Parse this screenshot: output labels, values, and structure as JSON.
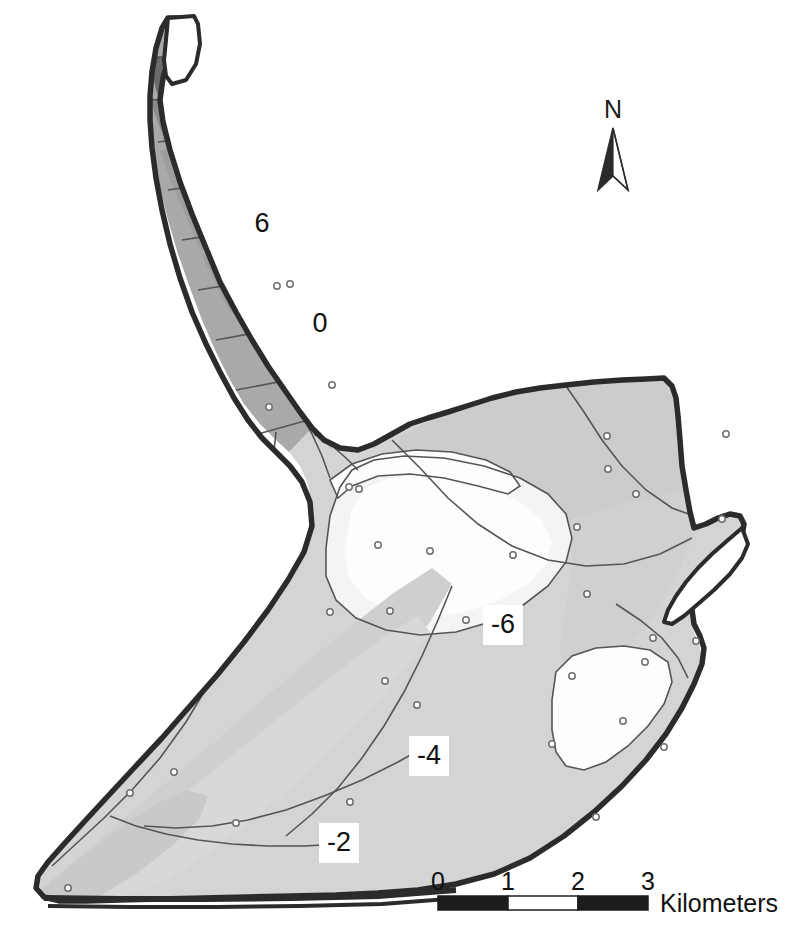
{
  "map": {
    "title": "",
    "background_color": "#ffffff",
    "outline_color": "#2b2b2b",
    "contour_line_color": "#555555",
    "point_marker_color": "#6e6e6e",
    "fill_levels": [
      {
        "name": "darkest",
        "color": "#686868",
        "value": "8"
      },
      {
        "name": "dark",
        "color": "#8d8d8d",
        "value": "6"
      },
      {
        "name": "medium",
        "color": "#a9a9a9",
        "value": "2"
      },
      {
        "name": "light",
        "color": "#c9c9c9",
        "value": "-2"
      },
      {
        "name": "lighter",
        "color": "#d6d6d6",
        "value": "-4"
      },
      {
        "name": "lightest",
        "color": "#e3e3e3",
        "value": "-6"
      },
      {
        "name": "white",
        "color": "#fdfdfd",
        "value": "-8"
      }
    ],
    "contour_labels": [
      {
        "id": "label-6",
        "text": "6",
        "x": 262,
        "y": 224
      },
      {
        "id": "label-0",
        "text": "0",
        "x": 320,
        "y": 324
      },
      {
        "id": "label-n6",
        "text": "-6",
        "x": 503,
        "y": 625
      },
      {
        "id": "label-n4",
        "text": "-4",
        "x": 429,
        "y": 756
      },
      {
        "id": "label-n2",
        "text": "-2",
        "x": 339,
        "y": 843
      }
    ],
    "sample_points": [
      [
        277,
        286
      ],
      [
        290,
        284
      ],
      [
        332,
        385
      ],
      [
        269,
        407
      ],
      [
        349,
        487
      ],
      [
        359,
        489
      ],
      [
        378,
        545
      ],
      [
        430,
        551
      ],
      [
        513,
        555
      ],
      [
        466,
        620
      ],
      [
        577,
        527
      ],
      [
        607,
        436
      ],
      [
        608,
        469
      ],
      [
        636,
        494
      ],
      [
        587,
        594
      ],
      [
        653,
        638
      ],
      [
        572,
        676
      ],
      [
        645,
        662
      ],
      [
        722,
        519
      ],
      [
        726,
        434
      ],
      [
        696,
        641
      ],
      [
        623,
        721
      ],
      [
        664,
        747
      ],
      [
        552,
        744
      ],
      [
        596,
        817
      ],
      [
        350,
        802
      ],
      [
        174,
        772
      ],
      [
        130,
        793
      ],
      [
        68,
        888
      ],
      [
        236,
        823
      ],
      [
        385,
        681
      ],
      [
        417,
        705
      ],
      [
        330,
        612
      ],
      [
        390,
        611
      ]
    ]
  },
  "north_arrow": {
    "label": "N",
    "label_x": 613,
    "label_y": 118,
    "icon": "north-arrow-icon"
  },
  "scale_bar": {
    "unit_label": "Kilometers",
    "ticks": [
      "0",
      "1",
      "2",
      "3"
    ],
    "tick_x": [
      438,
      508,
      578,
      648
    ],
    "bar_x": 438,
    "bar_y": 896,
    "bar_width": 210,
    "bar_height": 14,
    "segments": [
      {
        "fill": "#1c1c1c"
      },
      {
        "fill": "#ffffff"
      },
      {
        "fill": "#1c1c1c"
      }
    ],
    "unit_x": 660,
    "unit_y": 912
  }
}
